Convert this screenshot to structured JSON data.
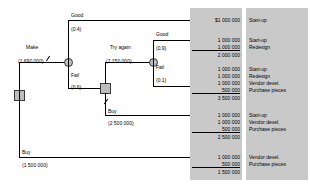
{
  "diagram": {
    "type": "decision-tree",
    "root": {
      "node": "decision-square"
    },
    "branches": {
      "make": {
        "label": "Make",
        "cost": "(1 690 000)"
      },
      "buy_root": {
        "label": "Buy",
        "cost": "(1 500 000)"
      },
      "good_1": {
        "label": "Good",
        "prob": "(0.4)"
      },
      "fail_1": {
        "label": "Fail",
        "prob": "(0.6)"
      },
      "try_again": {
        "label": "Try again",
        "cost": "(2 150 000)"
      },
      "buy_2": {
        "label": "Buy",
        "cost": "(2 500 000)"
      },
      "good_2": {
        "label": "Good",
        "prob": "(0.9)"
      },
      "fail_2": {
        "label": "Fail",
        "prob": "(0.1)"
      }
    },
    "outcomes": [
      {
        "id": "outcome-1",
        "amounts": [
          "$1 000 000"
        ],
        "labels": [
          "Start-up"
        ],
        "total": null
      },
      {
        "id": "outcome-2",
        "amounts": [
          "1 000 000",
          "1 000 000"
        ],
        "labels": [
          "Start-up",
          "Redesign"
        ],
        "total": "2 000 000"
      },
      {
        "id": "outcome-3",
        "amounts": [
          "1 000 000",
          "1 000 000",
          "1 000 000",
          "500 000"
        ],
        "labels": [
          "Start-up",
          "Redesign",
          "Vendor devel.",
          "Purchase pieces"
        ],
        "total": "3 500 000"
      },
      {
        "id": "outcome-4",
        "amounts": [
          "1 000 000",
          "1 000 000",
          "500 000"
        ],
        "labels": [
          "Start-up",
          "Vendor devel.",
          "Purchase pieces"
        ],
        "total": "2 500 000"
      },
      {
        "id": "outcome-5",
        "amounts": [
          "1 000 000",
          "500 000"
        ],
        "labels": [
          "Vendor devel.",
          "Purchase pieces"
        ],
        "total": "1 500 000"
      }
    ],
    "colors": {
      "panel": "#c9c9c9",
      "node_fill": "#bdbdbd",
      "stroke": "#000000"
    }
  }
}
